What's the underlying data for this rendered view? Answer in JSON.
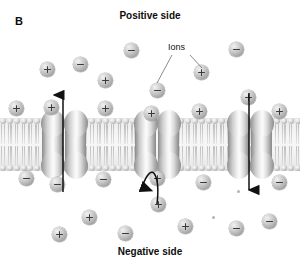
{
  "figure": {
    "panel_label": "B",
    "top_side_label": "Positive side",
    "bottom_side_label": "Negative side",
    "ions_callout_label": "Ions"
  },
  "colors": {
    "background": "#ffffff",
    "text": "#0d0d0d",
    "ion_fill": "#bdbdbd",
    "ion_glyph": "#3a3a3a",
    "membrane_core": "#f4f4f4",
    "lipid_head": "#c8c8c8",
    "protein_light": "#fbfbfb",
    "protein_dark": "#8d8d8d",
    "arrow": "#111111",
    "leader_line": "#5a5a5a"
  },
  "membrane": {
    "top": 118,
    "height": 53,
    "lipid_count": 44,
    "lipid_spacing": 6.85
  },
  "channels": [
    {
      "name": "left-channel",
      "x": 42,
      "label": "open-channel-outward"
    },
    {
      "name": "middle-channel",
      "x": 135,
      "label": "blocked-channel"
    },
    {
      "name": "right-channel",
      "x": 228,
      "label": "open-channel-inward"
    }
  ],
  "arrows": [
    {
      "name": "left-channel-arrow",
      "direction": "up",
      "x": 63,
      "y_start": 192,
      "y_end": 95
    },
    {
      "name": "middle-channel-arrow",
      "direction": "curved-up-blocked",
      "x": 157,
      "y_start": 204,
      "y_end": 155
    },
    {
      "name": "right-channel-arrow",
      "direction": "down",
      "x": 249,
      "y_start": 93,
      "y_end": 190
    }
  ],
  "leader_lines": [
    {
      "name": "ions-leader-left",
      "x1": 172,
      "y1": 55,
      "x2": 157,
      "y2": 83
    },
    {
      "name": "ions-leader-right",
      "x1": 190,
      "y1": 55,
      "x2": 202,
      "y2": 68
    }
  ],
  "ions": {
    "top_region": [
      {
        "charge": "+",
        "x": 40,
        "y": 62
      },
      {
        "charge": "-",
        "x": 73,
        "y": 57
      },
      {
        "charge": "+",
        "x": 98,
        "y": 73
      },
      {
        "charge": "-",
        "x": 124,
        "y": 43
      },
      {
        "charge": "-",
        "x": 150,
        "y": 83
      },
      {
        "charge": "+",
        "x": 194,
        "y": 65
      },
      {
        "charge": "-",
        "x": 229,
        "y": 42
      },
      {
        "charge": "+",
        "x": 44,
        "y": 100
      },
      {
        "charge": "+",
        "x": 98,
        "y": 101
      },
      {
        "charge": "+",
        "x": 144,
        "y": 106
      },
      {
        "charge": "+",
        "x": 192,
        "y": 104
      },
      {
        "charge": "+",
        "x": 241,
        "y": 90
      },
      {
        "charge": "+",
        "x": 272,
        "y": 104
      },
      {
        "charge": "+",
        "x": 9,
        "y": 101
      }
    ],
    "bottom_region": [
      {
        "charge": "-",
        "x": 19,
        "y": 171
      },
      {
        "charge": "-",
        "x": 50,
        "y": 177
      },
      {
        "charge": "-",
        "x": 96,
        "y": 172
      },
      {
        "charge": "+",
        "x": 151,
        "y": 197
      },
      {
        "charge": "+",
        "x": 150,
        "y": 171
      },
      {
        "charge": "-",
        "x": 196,
        "y": 175
      },
      {
        "charge": "-",
        "x": 272,
        "y": 175
      },
      {
        "charge": "+",
        "x": 82,
        "y": 210
      },
      {
        "charge": "+",
        "x": 52,
        "y": 227
      },
      {
        "charge": "-",
        "x": 118,
        "y": 226
      },
      {
        "charge": "+",
        "x": 178,
        "y": 219
      },
      {
        "charge": "-",
        "x": 229,
        "y": 221
      },
      {
        "charge": "-",
        "x": 262,
        "y": 214
      }
    ]
  },
  "specks": [
    {
      "x": 212,
      "y": 216
    },
    {
      "x": 237,
      "y": 190
    }
  ]
}
